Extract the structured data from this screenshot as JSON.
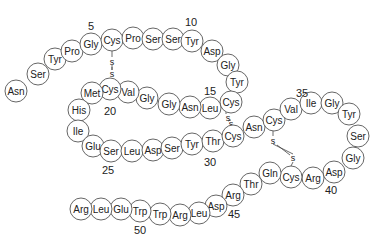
{
  "diagram": {
    "type": "peptide-sequence",
    "residue_radius": 11,
    "colors": {
      "circle_stroke": "#555555",
      "circle_fill": "#ffffff",
      "text": "#222222"
    },
    "residues": [
      {
        "n": 1,
        "aa": "Asn",
        "x": 16,
        "y": 91
      },
      {
        "n": 2,
        "aa": "Ser",
        "x": 38,
        "y": 74
      },
      {
        "n": 3,
        "aa": "Tyr",
        "x": 55,
        "y": 59
      },
      {
        "n": 4,
        "aa": "Pro",
        "x": 72,
        "y": 51
      },
      {
        "n": 5,
        "aa": "Gly",
        "x": 91,
        "y": 44
      },
      {
        "n": 6,
        "aa": "Cys",
        "x": 112,
        "y": 40
      },
      {
        "n": 7,
        "aa": "Pro",
        "x": 133,
        "y": 38
      },
      {
        "n": 8,
        "aa": "Ser",
        "x": 153,
        "y": 39
      },
      {
        "n": 9,
        "aa": "Ser",
        "x": 173,
        "y": 39
      },
      {
        "n": 10,
        "aa": "Tyr",
        "x": 192,
        "y": 41
      },
      {
        "n": 11,
        "aa": "Asp",
        "x": 212,
        "y": 51
      },
      {
        "n": 12,
        "aa": "Gly",
        "x": 228,
        "y": 65
      },
      {
        "n": 13,
        "aa": "Tyr",
        "x": 237,
        "y": 82
      },
      {
        "n": 14,
        "aa": "Cys",
        "x": 231,
        "y": 102
      },
      {
        "n": 15,
        "aa": "Leu",
        "x": 210,
        "y": 108
      },
      {
        "n": 16,
        "aa": "Asn",
        "x": 190,
        "y": 107
      },
      {
        "n": 17,
        "aa": "Gly",
        "x": 169,
        "y": 104
      },
      {
        "n": 18,
        "aa": "Gly",
        "x": 147,
        "y": 98
      },
      {
        "n": 19,
        "aa": "Val",
        "x": 128,
        "y": 92
      },
      {
        "n": 20,
        "aa": "Cys",
        "x": 110,
        "y": 89
      },
      {
        "n": 21,
        "aa": "Met",
        "x": 92,
        "y": 93
      },
      {
        "n": 22,
        "aa": "His",
        "x": 79,
        "y": 110
      },
      {
        "n": 23,
        "aa": "Ile",
        "x": 78,
        "y": 131
      },
      {
        "n": 24,
        "aa": "Glu",
        "x": 93,
        "y": 146
      },
      {
        "n": 25,
        "aa": "Ser",
        "x": 111,
        "y": 151
      },
      {
        "n": 26,
        "aa": "Leu",
        "x": 132,
        "y": 151
      },
      {
        "n": 27,
        "aa": "Asp",
        "x": 153,
        "y": 150
      },
      {
        "n": 28,
        "aa": "Ser",
        "x": 172,
        "y": 148
      },
      {
        "n": 29,
        "aa": "Tyr",
        "x": 192,
        "y": 144
      },
      {
        "n": 30,
        "aa": "Thr",
        "x": 213,
        "y": 141
      },
      {
        "n": 31,
        "aa": "Cys",
        "x": 233,
        "y": 136
      },
      {
        "n": 32,
        "aa": "Asn",
        "x": 254,
        "y": 127
      },
      {
        "n": 33,
        "aa": "Cys",
        "x": 274,
        "y": 120
      },
      {
        "n": 34,
        "aa": "Val",
        "x": 291,
        "y": 109
      },
      {
        "n": 35,
        "aa": "Ile",
        "x": 311,
        "y": 103
      },
      {
        "n": 36,
        "aa": "Gly",
        "x": 332,
        "y": 103
      },
      {
        "n": 37,
        "aa": "Tyr",
        "x": 349,
        "y": 114
      },
      {
        "n": 38,
        "aa": "Ser",
        "x": 358,
        "y": 136
      },
      {
        "n": 39,
        "aa": "Gly",
        "x": 353,
        "y": 158
      },
      {
        "n": 40,
        "aa": "Asp",
        "x": 334,
        "y": 172
      },
      {
        "n": 41,
        "aa": "Arg",
        "x": 313,
        "y": 178
      },
      {
        "n": 42,
        "aa": "Cys",
        "x": 291,
        "y": 177
      },
      {
        "n": 43,
        "aa": "Gln",
        "x": 270,
        "y": 173
      },
      {
        "n": 44,
        "aa": "Thr",
        "x": 251,
        "y": 184
      },
      {
        "n": 45,
        "aa": "Arg",
        "x": 233,
        "y": 195
      },
      {
        "n": 46,
        "aa": "Asp",
        "x": 216,
        "y": 206
      },
      {
        "n": 47,
        "aa": "Leu",
        "x": 199,
        "y": 213
      },
      {
        "n": 48,
        "aa": "Arg",
        "x": 180,
        "y": 215
      },
      {
        "n": 49,
        "aa": "Trp",
        "x": 160,
        "y": 214
      },
      {
        "n": 50,
        "aa": "Trp",
        "x": 140,
        "y": 211
      },
      {
        "n": 51,
        "aa": "Glu",
        "x": 121,
        "y": 209
      },
      {
        "n": 52,
        "aa": "Leu",
        "x": 101,
        "y": 209
      },
      {
        "n": 53,
        "aa": "Arg",
        "x": 81,
        "y": 209
      }
    ],
    "position_labels": [
      {
        "text": "5",
        "x": 91,
        "y": 30
      },
      {
        "text": "10",
        "x": 191,
        "y": 26
      },
      {
        "text": "15",
        "x": 210,
        "y": 95
      },
      {
        "text": "20",
        "x": 110,
        "y": 115
      },
      {
        "text": "25",
        "x": 108,
        "y": 174
      },
      {
        "text": "30",
        "x": 210,
        "y": 166
      },
      {
        "text": "35",
        "x": 302,
        "y": 97
      },
      {
        "text": "40",
        "x": 331,
        "y": 194
      },
      {
        "text": "45",
        "x": 234,
        "y": 218
      },
      {
        "text": "50",
        "x": 140,
        "y": 234
      }
    ],
    "disulfide_bonds": [
      {
        "from": 6,
        "to": 20,
        "s1": {
          "x": 112,
          "y": 62
        },
        "s2": {
          "x": 112,
          "y": 74
        },
        "line": [
          [
            112,
            51
          ],
          [
            112,
            57
          ],
          [
            112,
            67
          ],
          [
            112,
            70
          ],
          [
            112,
            78
          ],
          [
            112,
            78
          ]
        ]
      },
      {
        "from": 14,
        "to": 31,
        "s1": {
          "x": 228,
          "y": 118
        },
        "s2": {
          "x": 231,
          "y": 124
        },
        "line": [
          [
            226,
            112
          ],
          [
            226,
            114
          ],
          [
            233,
            128
          ],
          [
            233,
            125
          ]
        ]
      },
      {
        "from": 33,
        "to": 42,
        "s1": {
          "x": 273,
          "y": 141
        },
        "s2": {
          "x": 293,
          "y": 158
        },
        "line": [
          [
            273,
            131
          ],
          [
            273,
            136
          ],
          [
            277,
            145
          ],
          [
            290,
            155
          ],
          [
            293,
            162
          ],
          [
            291,
            166
          ]
        ]
      }
    ],
    "sulfur_label": "s"
  }
}
